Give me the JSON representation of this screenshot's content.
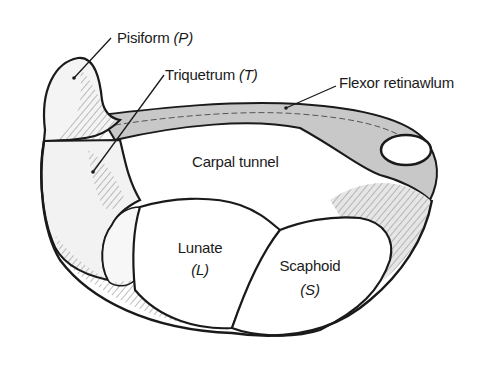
{
  "diagram": {
    "labels": {
      "pisiform": {
        "name": "Pisiform",
        "abbr": "(P)"
      },
      "triquetrum": {
        "name": "Triquetrum",
        "abbr": "(T)"
      },
      "flexor_retinaculum": {
        "name": "Flexor retinawlum"
      },
      "carpal_tunnel": {
        "name": "Carpal tunnel"
      },
      "lunate": {
        "name": "Lunate",
        "abbr": "(L)"
      },
      "scaphoid": {
        "name": "Scaphoid",
        "abbr": "(S)"
      }
    },
    "colors": {
      "outline": "#1a1a1a",
      "bone_fill": "#f4f4f4",
      "ligament_fill": "#bdbdbd",
      "background": "#ffffff"
    }
  }
}
